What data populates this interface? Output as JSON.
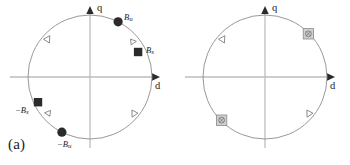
{
  "figure": {
    "background_color": "#ffffff",
    "axis_color": "#b9b9b9",
    "circle_color": "#8d8d8d",
    "marker_fill_dark": "#2b2b2b",
    "marker_fill_grey": "#c9c9c9",
    "text_color": "#1b1b1b"
  },
  "panels": [
    {
      "id": "a",
      "caption": "(a)",
      "axes": {
        "x_label": "d",
        "y_label": "q"
      },
      "markers": [
        {
          "kind": "filled-circle",
          "label": "Bu",
          "label_base": "B",
          "label_sub": "u",
          "angle_deg": 63
        },
        {
          "kind": "open-triangle",
          "label": "",
          "label_base": "",
          "label_sub": "",
          "angle_deg": 47
        },
        {
          "kind": "filled-square",
          "label": "Bs",
          "label_base": "B",
          "label_sub": "s",
          "angle_deg": 33
        },
        {
          "kind": "open-triangle",
          "label": "",
          "label_base": "",
          "label_sub": "",
          "angle_deg": 137
        },
        {
          "kind": "filled-square",
          "label": "-Bs",
          "label_base": "−B",
          "label_sub": "s",
          "angle_deg": 213
        },
        {
          "kind": "open-triangle",
          "label": "",
          "label_base": "",
          "label_sub": "",
          "angle_deg": 227
        },
        {
          "kind": "filled-circle",
          "label": "-Bu",
          "label_base": "−B",
          "label_sub": "u",
          "angle_deg": 243
        },
        {
          "kind": "open-triangle",
          "label": "",
          "label_base": "",
          "label_sub": "",
          "angle_deg": 317
        }
      ]
    },
    {
      "id": "b",
      "caption": "(b)",
      "axes": {
        "x_label": "d",
        "y_label": "q"
      },
      "markers": [
        {
          "kind": "grey-square-crossed",
          "label": "",
          "label_base": "",
          "label_sub": "",
          "angle_deg": 47
        },
        {
          "kind": "open-triangle",
          "label": "",
          "label_base": "",
          "label_sub": "",
          "angle_deg": 137
        },
        {
          "kind": "grey-square-crossed",
          "label": "",
          "label_base": "",
          "label_sub": "",
          "angle_deg": 227
        },
        {
          "kind": "open-triangle",
          "label": "",
          "label_base": "",
          "label_sub": "",
          "angle_deg": 317
        }
      ]
    }
  ]
}
